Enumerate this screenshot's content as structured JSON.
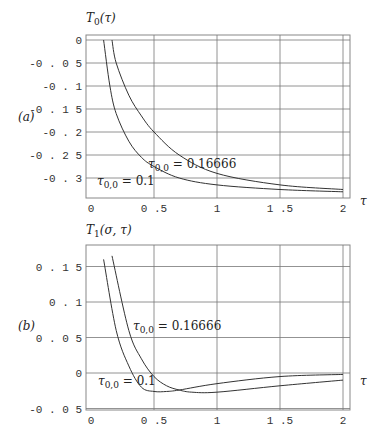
{
  "chart_data": [
    {
      "type": "line",
      "panel_label": "(a)",
      "title": "T_0(τ)",
      "ylabel": "T_0(τ)",
      "xlabel": "τ",
      "xlim": [
        0,
        2
      ],
      "ylim": [
        -0.34,
        0
      ],
      "xticks": [
        "0",
        "0.5",
        "1",
        "1.5",
        "2"
      ],
      "yticks": [
        "0",
        "-0.05",
        "-0.1",
        "-0.15",
        "-0.2",
        "-0.25",
        "-0.3"
      ],
      "grid": true,
      "series": [
        {
          "name": "τ_{0,0} = 0.1",
          "x": [
            0.1,
            0.15,
            0.2,
            0.3,
            0.4,
            0.5,
            0.7,
            1.0,
            1.5,
            2.0
          ],
          "y": [
            0.0,
            -0.1,
            -0.16,
            -0.22,
            -0.255,
            -0.275,
            -0.3,
            -0.315,
            -0.325,
            -0.33
          ]
        },
        {
          "name": "τ_{0,0} = 0.16666",
          "x": [
            0.1666,
            0.2,
            0.3,
            0.4,
            0.5,
            0.7,
            1.0,
            1.5,
            2.0
          ],
          "y": [
            0.0,
            -0.05,
            -0.12,
            -0.165,
            -0.2,
            -0.25,
            -0.29,
            -0.315,
            -0.325
          ]
        }
      ],
      "annotations": [
        {
          "text": "τ_{0,0} = 0.16666",
          "x": 0.6,
          "y": -0.2
        },
        {
          "text": "τ_{0,0} = 0.1",
          "x": 0.15,
          "y": -0.28
        }
      ]
    },
    {
      "type": "line",
      "panel_label": "(b)",
      "title": "T_1(σ,τ)",
      "ylabel": "T_1(σ,τ)",
      "xlabel": "τ",
      "xlim": [
        0,
        2
      ],
      "ylim": [
        -0.05,
        0.18
      ],
      "xticks": [
        "0",
        "0.5",
        "1",
        "1.5",
        "2"
      ],
      "yticks": [
        "0.15",
        "0.1",
        "0.05",
        "0",
        "-0.05"
      ],
      "grid": true,
      "series": [
        {
          "name": "τ_{0,0} = 0.1",
          "x": [
            0.1,
            0.2,
            0.3,
            0.4,
            0.5,
            0.6,
            0.7,
            1.0,
            1.5,
            2.0
          ],
          "y": [
            0.16,
            0.06,
            0.01,
            -0.02,
            -0.026,
            -0.026,
            -0.024,
            -0.015,
            -0.005,
            -0.002
          ]
        },
        {
          "name": "τ_{0,0} = 0.16666",
          "x": [
            0.1666,
            0.3,
            0.4,
            0.5,
            0.6,
            0.7,
            0.8,
            1.0,
            1.5,
            2.0
          ],
          "y": [
            0.165,
            0.06,
            0.02,
            -0.005,
            -0.018,
            -0.024,
            -0.027,
            -0.027,
            -0.018,
            -0.01
          ]
        }
      ],
      "annotations": [
        {
          "text": "τ_{0,0} = 0.16666",
          "x": 0.65,
          "y": 0.065
        },
        {
          "text": "τ_{0,0} = 0.1",
          "x": 0.15,
          "y": -0.01
        }
      ]
    }
  ],
  "labels": {
    "a": {
      "panel": "(a)",
      "ylabel_main": "T",
      "ylabel_sub": "0",
      "ylabel_arg": "(τ)",
      "xlabel": "τ",
      "ann1_main": "τ",
      "ann1_sub": "0,0",
      "ann1_val": " = 0.16666",
      "ann2_main": "τ",
      "ann2_sub": "0,0",
      "ann2_val": " = 0.1"
    },
    "b": {
      "panel": "(b)",
      "ylabel_main": "T",
      "ylabel_sub": "1",
      "ylabel_arg": "(σ, τ)",
      "xlabel": "τ",
      "ann1_main": "τ",
      "ann1_sub": "0,0",
      "ann1_val": " = 0.16666",
      "ann2_main": "τ",
      "ann2_sub": "0,0",
      "ann2_val": " = 0.1"
    }
  }
}
